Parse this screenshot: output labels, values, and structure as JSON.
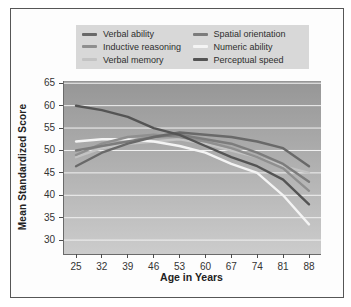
{
  "figure": {
    "border_color": "#565656",
    "background": "#fdfdfd"
  },
  "legend": {
    "background": "#d8d8d8",
    "items": [
      {
        "label": "Verbal ability",
        "color": "#696969"
      },
      {
        "label": "Inductive reasoning",
        "color": "#8f8f8f"
      },
      {
        "label": "Verbal memory",
        "color": "#c3c3c3"
      },
      {
        "label": "Spatial orientation",
        "color": "#7c7c7c"
      },
      {
        "label": "Numeric ability",
        "color": "#f4f4f4"
      },
      {
        "label": "Perceptual speed",
        "color": "#545454"
      }
    ]
  },
  "chart_data": {
    "type": "line",
    "title": "",
    "xlabel": "Age in Years",
    "ylabel": "Mean Standardized Score",
    "x": [
      25,
      32,
      39,
      46,
      53,
      60,
      67,
      74,
      81,
      88
    ],
    "y_ticks": [
      30,
      35,
      40,
      45,
      50,
      55,
      60,
      65
    ],
    "ylim": [
      26.9,
      65.5
    ],
    "grid": true,
    "gridline_color": "#f2f2f2",
    "legend_position": "top",
    "plot_background": {
      "top": "#969696",
      "bottom": "#cccccc"
    },
    "series": [
      {
        "name": "Verbal memory",
        "color": "#c3c3c3",
        "values": [
          48.5,
          50.5,
          51.5,
          52.0,
          52.5,
          51.5,
          50.0,
          48.5,
          46.5,
          45.0
        ]
      },
      {
        "name": "Numeric ability",
        "color": "#f4f4f4",
        "values": [
          52.0,
          52.5,
          52.5,
          52.0,
          51.0,
          49.5,
          47.0,
          45.0,
          40.0,
          33.5
        ]
      },
      {
        "name": "Inductive reasoning",
        "color": "#8f8f8f",
        "values": [
          49.0,
          51.5,
          53.0,
          53.5,
          53.0,
          52.0,
          50.5,
          48.5,
          46.0,
          41.0
        ]
      },
      {
        "name": "Spatial orientation",
        "color": "#7c7c7c",
        "values": [
          50.0,
          51.0,
          52.0,
          53.0,
          53.5,
          52.5,
          51.5,
          49.5,
          47.0,
          43.0
        ]
      },
      {
        "name": "Verbal ability",
        "color": "#696969",
        "values": [
          46.5,
          49.5,
          51.5,
          53.0,
          54.0,
          53.5,
          53.0,
          52.0,
          50.5,
          46.5
        ]
      },
      {
        "name": "Perceptual speed",
        "color": "#545454",
        "values": [
          60.0,
          59.0,
          57.5,
          55.0,
          53.5,
          51.0,
          48.5,
          46.5,
          43.5,
          38.0
        ]
      }
    ]
  }
}
